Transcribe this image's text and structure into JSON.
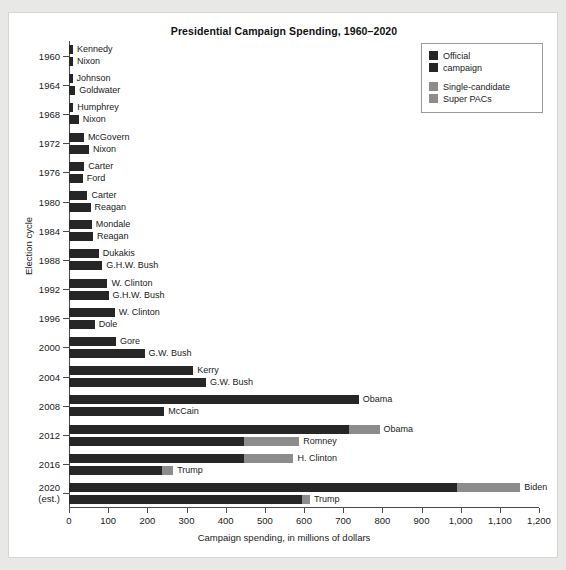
{
  "chart_data": {
    "type": "bar",
    "orientation": "horizontal",
    "title": "Presidential Campaign Spending, 1960–2020",
    "xlabel": "Campaign spending, in millions of dollars",
    "ylabel": "Election cycle",
    "xlim": [
      0,
      1200
    ],
    "xticks": [
      0,
      100,
      200,
      300,
      400,
      500,
      600,
      700,
      800,
      900,
      1000,
      1100,
      1200
    ],
    "xticklabels": [
      "0",
      "100",
      "200",
      "300",
      "400",
      "500",
      "600",
      "700",
      "800",
      "900",
      "1,000",
      "1,100",
      "1,200"
    ],
    "grid": false,
    "legend_position": "top-right",
    "series": [
      {
        "name": "Official campaign",
        "color": "#262626"
      },
      {
        "name": "Single-candidate Super PACs",
        "color": "#8c8c8c"
      }
    ],
    "cycles": [
      {
        "year": "1960",
        "tick_label": "1960",
        "sub_label": ""
      },
      {
        "year": "1964",
        "tick_label": "1964",
        "sub_label": ""
      },
      {
        "year": "1968",
        "tick_label": "1968",
        "sub_label": ""
      },
      {
        "year": "1972",
        "tick_label": "1972",
        "sub_label": ""
      },
      {
        "year": "1976",
        "tick_label": "1976",
        "sub_label": ""
      },
      {
        "year": "1980",
        "tick_label": "1980",
        "sub_label": ""
      },
      {
        "year": "1984",
        "tick_label": "1984",
        "sub_label": ""
      },
      {
        "year": "1988",
        "tick_label": "1988",
        "sub_label": ""
      },
      {
        "year": "1992",
        "tick_label": "1992",
        "sub_label": ""
      },
      {
        "year": "1996",
        "tick_label": "1996",
        "sub_label": ""
      },
      {
        "year": "2000",
        "tick_label": "2000",
        "sub_label": ""
      },
      {
        "year": "2004",
        "tick_label": "2004",
        "sub_label": ""
      },
      {
        "year": "2008",
        "tick_label": "2008",
        "sub_label": ""
      },
      {
        "year": "2012",
        "tick_label": "2012",
        "sub_label": ""
      },
      {
        "year": "2016",
        "tick_label": "2016",
        "sub_label": ""
      },
      {
        "year": "2020",
        "tick_label": "2020",
        "sub_label": "(est.)"
      }
    ],
    "bars": [
      {
        "cycle": "1960",
        "candidate": "Kennedy",
        "official": 10,
        "super_pac": 0
      },
      {
        "cycle": "1960",
        "candidate": "Nixon",
        "official": 10,
        "super_pac": 0
      },
      {
        "cycle": "1964",
        "candidate": "Johnson",
        "official": 9,
        "super_pac": 0
      },
      {
        "cycle": "1964",
        "candidate": "Goldwater",
        "official": 16,
        "super_pac": 0
      },
      {
        "cycle": "1968",
        "candidate": "Humphrey",
        "official": 11,
        "super_pac": 0
      },
      {
        "cycle": "1968",
        "candidate": "Nixon",
        "official": 25,
        "super_pac": 0
      },
      {
        "cycle": "1972",
        "candidate": "McGovern",
        "official": 38,
        "super_pac": 0
      },
      {
        "cycle": "1972",
        "candidate": "Nixon",
        "official": 51,
        "super_pac": 0
      },
      {
        "cycle": "1976",
        "candidate": "Carter",
        "official": 39,
        "super_pac": 0
      },
      {
        "cycle": "1976",
        "candidate": "Ford",
        "official": 35,
        "super_pac": 0
      },
      {
        "cycle": "1980",
        "candidate": "Carter",
        "official": 47,
        "super_pac": 0
      },
      {
        "cycle": "1980",
        "candidate": "Reagan",
        "official": 55,
        "super_pac": 0
      },
      {
        "cycle": "1984",
        "candidate": "Mondale",
        "official": 58,
        "super_pac": 0
      },
      {
        "cycle": "1984",
        "candidate": "Reagan",
        "official": 61,
        "super_pac": 0
      },
      {
        "cycle": "1988",
        "candidate": "Dukakis",
        "official": 76,
        "super_pac": 0
      },
      {
        "cycle": "1988",
        "candidate": "G.H.W. Bush",
        "official": 85,
        "super_pac": 0
      },
      {
        "cycle": "1992",
        "candidate": "W. Clinton",
        "official": 98,
        "super_pac": 0
      },
      {
        "cycle": "1992",
        "candidate": "G.H.W. Bush",
        "official": 101,
        "super_pac": 0
      },
      {
        "cycle": "1996",
        "candidate": "W. Clinton",
        "official": 117,
        "super_pac": 0
      },
      {
        "cycle": "1996",
        "candidate": "Dole",
        "official": 66,
        "super_pac": 0
      },
      {
        "cycle": "2000",
        "candidate": "Gore",
        "official": 120,
        "super_pac": 0
      },
      {
        "cycle": "2000",
        "candidate": "G.W. Bush",
        "official": 193,
        "super_pac": 0
      },
      {
        "cycle": "2004",
        "candidate": "Kerry",
        "official": 317,
        "super_pac": 0
      },
      {
        "cycle": "2004",
        "candidate": "G.W. Bush",
        "official": 350,
        "super_pac": 0
      },
      {
        "cycle": "2008",
        "candidate": "Obama",
        "official": 740,
        "super_pac": 0
      },
      {
        "cycle": "2008",
        "candidate": "McCain",
        "official": 243,
        "super_pac": 0
      },
      {
        "cycle": "2012",
        "candidate": "Obama",
        "official": 715,
        "super_pac": 78
      },
      {
        "cycle": "2012",
        "candidate": "Romney",
        "official": 446,
        "super_pac": 142
      },
      {
        "cycle": "2016",
        "candidate": "H. Clinton",
        "official": 446,
        "super_pac": 127
      },
      {
        "cycle": "2016",
        "candidate": "Trump",
        "official": 237,
        "super_pac": 29
      },
      {
        "cycle": "2020",
        "candidate": "Biden",
        "official": 990,
        "super_pac": 162
      },
      {
        "cycle": "2020",
        "candidate": "Trump",
        "official": 595,
        "super_pac": 20
      }
    ]
  },
  "legend": {
    "entries": [
      {
        "line1": "Official",
        "line2": "campaign"
      },
      {
        "line1": "Single-candidate",
        "line2": "Super PACs"
      }
    ]
  }
}
